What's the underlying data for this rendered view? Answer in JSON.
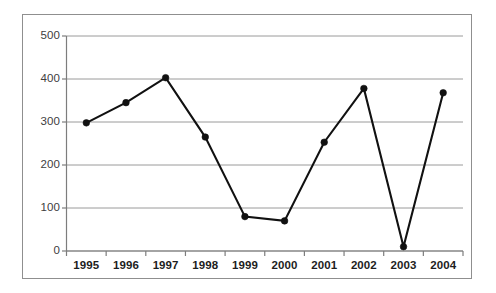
{
  "chart_data": {
    "type": "line",
    "title": "",
    "subtitle": "",
    "xlabel": "",
    "ylabel": "",
    "categories": [
      "1995",
      "1996",
      "1997",
      "1998",
      "1999",
      "2000",
      "2001",
      "2002",
      "2003",
      "2004"
    ],
    "values": [
      298,
      345,
      403,
      265,
      80,
      70,
      253,
      378,
      10,
      368
    ],
    "series": [
      {
        "name": "",
        "values": [
          298,
          345,
          403,
          265,
          80,
          70,
          253,
          378,
          10,
          368
        ]
      }
    ],
    "ylim": [
      0,
      500
    ],
    "ytick_labels": [
      "0",
      "100",
      "200",
      "300",
      "400",
      "500"
    ],
    "ytick_values": [
      0,
      100,
      200,
      300,
      400,
      500
    ],
    "xtick_labels": [
      "1995",
      "1996",
      "1997",
      "1998",
      "1999",
      "2000",
      "2001",
      "2002",
      "2003",
      "2004"
    ],
    "grid": "horizontal",
    "legend": "none",
    "marker": "filled-circle",
    "line_color": "#111111",
    "marker_color": "#111111",
    "grid_color": "#9a9a9a",
    "axis_color": "#7d7d7d",
    "frame_color": "#8f8f8f",
    "background_color": "#ffffff",
    "annotations": []
  }
}
